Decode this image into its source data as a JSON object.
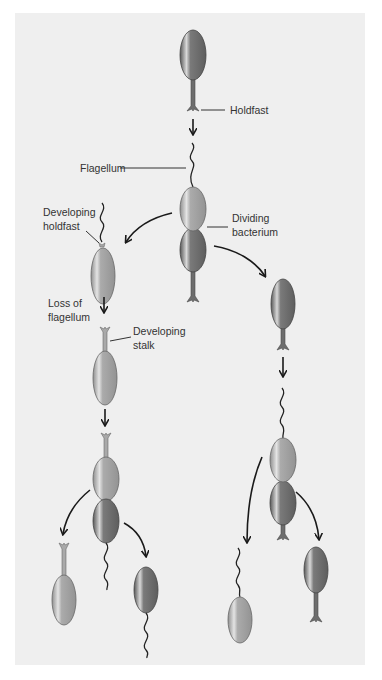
{
  "figure": {
    "labels": {
      "holdfast": "Holdfast",
      "flagellum": "Flagellum",
      "dividing_line1": "Dividing",
      "dividing_line2": "bacterium",
      "dev_holdfast_line1": "Developing",
      "dev_holdfast_line2": "holdfast",
      "loss_line1": "Loss of",
      "loss_line2": "flagellum",
      "dev_stalk_line1": "Developing",
      "dev_stalk_line2": "stalk"
    },
    "colors": {
      "background": "#ffffff",
      "panel": "#efefef",
      "cell_dark": "#6f6f6f",
      "cell_light": "#a6a6a6",
      "line": "#333333"
    },
    "stages": [
      "Stalked cell with holdfast",
      "Dividing bacterium with flagellum",
      "Swarmer cell with developing holdfast",
      "Loss of flagellum",
      "Developing stalk",
      "Stalked cell divides",
      "Daughter cells: stalked and swarmer"
    ]
  }
}
